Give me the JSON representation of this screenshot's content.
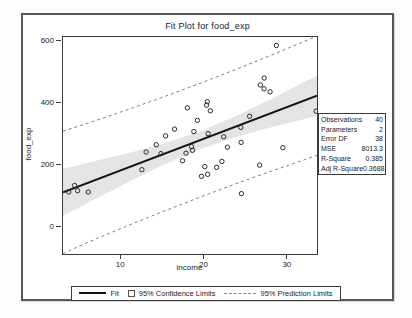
{
  "figure": {
    "title": "Fit Plot for food_exp"
  },
  "chart_data": {
    "type": "scatter",
    "title": "Fit Plot for food_exp",
    "xlabel": "income",
    "ylabel": "food_exp",
    "xlim": [
      3.0,
      33.5
    ],
    "ylim": [
      -85,
      615
    ],
    "xticks": [
      10,
      20,
      30
    ],
    "yticks": [
      0,
      200,
      400,
      600
    ],
    "grid": false,
    "legend_position": "bottom",
    "points": [
      [
        3.69,
        115.22
      ],
      [
        4.39,
        135.98
      ],
      [
        4.75,
        119.34
      ],
      [
        6.03,
        114.96
      ],
      [
        12.47,
        187.05
      ],
      [
        12.98,
        243.92
      ],
      [
        14.2,
        267.43
      ],
      [
        14.76,
        238.71
      ],
      [
        15.32,
        295.94
      ],
      [
        16.39,
        317.78
      ],
      [
        17.35,
        216.0
      ],
      [
        17.77,
        240.35
      ],
      [
        17.93,
        386.57
      ],
      [
        18.43,
        261.53
      ],
      [
        18.55,
        249.34
      ],
      [
        18.71,
        309.87
      ],
      [
        19.14,
        345.89
      ],
      [
        19.63,
        165.54
      ],
      [
        20.03,
        196.98
      ],
      [
        20.24,
        395.26
      ],
      [
        20.33,
        406.34
      ],
      [
        20.37,
        171.92
      ],
      [
        20.43,
        303.23
      ],
      [
        20.69,
        377.04
      ],
      [
        21.45,
        194.35
      ],
      [
        22.08,
        213.48
      ],
      [
        22.3,
        293.3
      ],
      [
        22.74,
        259.61
      ],
      [
        24.35,
        323.39
      ],
      [
        24.39,
        275.02
      ],
      [
        24.42,
        109.71
      ],
      [
        25.41,
        359.19
      ],
      [
        26.61,
        201.51
      ],
      [
        26.7,
        460.36
      ],
      [
        27.14,
        447.76
      ],
      [
        27.16,
        482.55
      ],
      [
        27.86,
        438.29
      ],
      [
        28.62,
        587.66
      ],
      [
        29.4,
        257.95
      ],
      [
        33.4,
        375.73
      ]
    ],
    "fit_line": {
      "intercept": 83.42,
      "slope": 10.21
    },
    "confidence_band": {
      "x": [
        3.0,
        7.0,
        11.0,
        15.0,
        19.6,
        24.0,
        28.0,
        33.5
      ],
      "lower": [
        38,
        94,
        149,
        202,
        255,
        294,
        324,
        360
      ],
      "upper": [
        190,
        216,
        242,
        271,
        312,
        363,
        415,
        491
      ]
    },
    "prediction_limits": {
      "x": [
        3.0,
        7.0,
        11.0,
        15.0,
        19.6,
        24.0,
        28.0,
        33.5
      ],
      "lower": [
        -83,
        -36,
        9,
        52,
        100,
        144,
        182,
        233
      ],
      "upper": [
        311,
        346,
        383,
        421,
        467,
        513,
        556,
        618
      ]
    }
  },
  "stats_table": {
    "rows": [
      {
        "label": "Observations",
        "value": "40"
      },
      {
        "label": "Parameters",
        "value": "2"
      },
      {
        "label": "Error DF",
        "value": "38"
      },
      {
        "label": "MSE",
        "value": "8013.3"
      },
      {
        "label": "R-Square",
        "value": "0.385"
      },
      {
        "label": "Adj R-Square",
        "value": "0.3688"
      }
    ]
  },
  "legend": {
    "items": [
      {
        "swatch": "solid-line",
        "label": "Fit"
      },
      {
        "swatch": "open-square",
        "label": "95% Confidence Limits"
      },
      {
        "swatch": "dashed-line",
        "label": "95% Prediction Limits"
      }
    ]
  },
  "colors": {
    "confidence_band": "#e4e4e4",
    "fit_line": "#141414",
    "prediction_line": "#808080",
    "marker_stroke": "#2a2a2a",
    "frame_border": "#58585a",
    "axis_border": "#3a3a3a"
  }
}
